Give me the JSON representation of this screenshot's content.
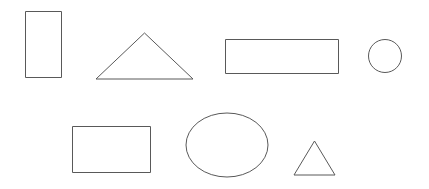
{
  "canvas": {
    "width": 429,
    "height": 189,
    "background_color": "#ffffff",
    "stroke_color": "#595959",
    "stroke_width": 1,
    "fill": "none",
    "description": "Outline geometric shapes arranged in two rows"
  },
  "shapes": [
    {
      "id": "rectangle-tall",
      "type": "rectangle",
      "row": 1,
      "order": 1,
      "x": 25,
      "y": 11,
      "width": 36,
      "height": 66
    },
    {
      "id": "triangle-large",
      "type": "triangle",
      "row": 1,
      "order": 2,
      "apex_x": 144.5,
      "apex_y": 33,
      "base_left_x": 96,
      "base_right_x": 193,
      "base_y": 79,
      "points": "144.5,33 193,79 96,79"
    },
    {
      "id": "rectangle-wide",
      "type": "rectangle",
      "row": 1,
      "order": 3,
      "x": 225,
      "y": 39,
      "width": 113,
      "height": 34
    },
    {
      "id": "circle-small",
      "type": "circle",
      "row": 1,
      "order": 4,
      "cx": 385,
      "cy": 56,
      "r": 16.5
    },
    {
      "id": "rectangle-medium",
      "type": "rectangle",
      "row": 2,
      "order": 1,
      "x": 72,
      "y": 126,
      "width": 78,
      "height": 46
    },
    {
      "id": "ellipse-wide",
      "type": "ellipse",
      "row": 2,
      "order": 2,
      "cx": 227,
      "cy": 145,
      "rx": 41,
      "ry": 32
    },
    {
      "id": "triangle-small",
      "type": "triangle",
      "row": 2,
      "order": 3,
      "apex_x": 314.5,
      "apex_y": 141,
      "base_left_x": 294,
      "base_right_x": 335,
      "base_y": 175,
      "points": "314.5,141 335,175 294,175"
    }
  ]
}
